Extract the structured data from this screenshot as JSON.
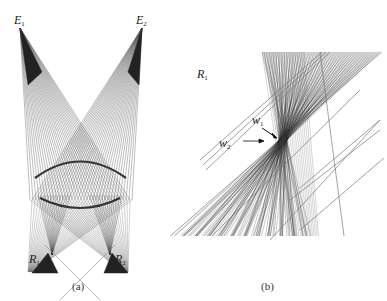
{
  "panels": [
    {
      "id": "a",
      "caption": "(a)",
      "labels": {
        "emitter_1": {
          "base": "E",
          "sub": "1"
        },
        "emitter_2": {
          "base": "E",
          "sub": "2"
        },
        "receiver_1": {
          "base": "R",
          "sub": "1"
        },
        "receiver_2": {
          "base": "R",
          "sub": "2"
        }
      }
    },
    {
      "id": "b",
      "caption": "(b)",
      "labels": {
        "receiver_1": {
          "base": "R",
          "sub": "1"
        },
        "waist_1": {
          "base": "w",
          "sub": "1"
        },
        "waist_2": {
          "base": "w",
          "sub": "2"
        }
      }
    }
  ],
  "colors": {
    "ray": "#555555",
    "ray_dense": "#222222",
    "lens": "#333333",
    "background": "#ffffff"
  }
}
